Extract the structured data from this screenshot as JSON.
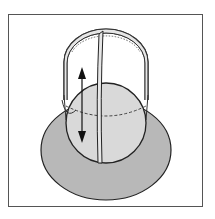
{
  "figure": {
    "label": "Sphere with vertical guide ring on base",
    "colors": {
      "frame_border": "#555555",
      "background": "#ffffff",
      "base_fill": "#b8b8b8",
      "sphere_fill": "#d9d9d9",
      "ring_fill": "#e6e6e6",
      "stroke": "#222222"
    },
    "elements": {
      "base": "elliptical base plate",
      "sphere": "sphere resting on base",
      "cage": "semicircular cage / ring over sphere",
      "band": "central vertical band",
      "arrow": "double-headed vertical arrow indicating up/down motion"
    }
  }
}
